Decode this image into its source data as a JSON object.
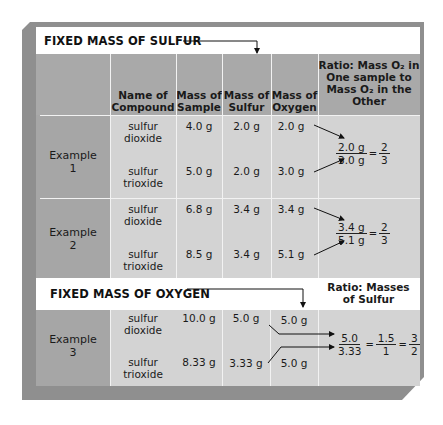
{
  "sections": {
    "fixed_sulfur_title": "FIXED MASS OF SULFUR",
    "fixed_oxygen_title": "FIXED MASS OF OXYGEN",
    "oxygen_ratio_header": [
      "Ratio: Masses",
      "of Sulfur"
    ]
  },
  "headers": {
    "name": [
      "Name of",
      "Compound"
    ],
    "sample": [
      "Mass of",
      "Sample"
    ],
    "sulfur": [
      "Mass of",
      "Sulfur"
    ],
    "oxygen": [
      "Mass of",
      "Oxygen"
    ],
    "ratio": [
      "Ratio: Mass O₂ in",
      "One sample to",
      "Mass O₂ in the",
      "Other"
    ]
  },
  "examples": [
    {
      "label": [
        "Example",
        "1"
      ],
      "rows": [
        {
          "name": [
            "sulfur",
            "dioxide"
          ],
          "sample": "4.0 g",
          "sulfur": "2.0 g",
          "oxygen": "2.0 g"
        },
        {
          "name": [
            "sulfur",
            "trioxide"
          ],
          "sample": "5.0 g",
          "sulfur": "2.0 g",
          "oxygen": "3.0 g"
        }
      ],
      "ratio": {
        "num": "2.0 g",
        "den": "3.0 g",
        "eq": "=",
        "rnum": "2",
        "rden": "3"
      }
    },
    {
      "label": [
        "Example",
        "2"
      ],
      "rows": [
        {
          "name": [
            "sulfur",
            "dioxide"
          ],
          "sample": "6.8 g",
          "sulfur": "3.4 g",
          "oxygen": "3.4 g"
        },
        {
          "name": [
            "sulfur",
            "trioxide"
          ],
          "sample": "8.5 g",
          "sulfur": "3.4 g",
          "oxygen": "5.1 g"
        }
      ],
      "ratio": {
        "num": "3.4 g",
        "den": "5.1 g",
        "eq": "=",
        "rnum": "2",
        "rden": "3"
      }
    },
    {
      "label": [
        "Example",
        "3"
      ],
      "rows": [
        {
          "name": [
            "sulfur",
            "dioxide"
          ],
          "sample": "10.0 g",
          "sulfur": "5.0 g",
          "oxygen": "5.0 g"
        },
        {
          "name": [
            "sulfur",
            "trioxide"
          ],
          "sample": "8.33 g",
          "sulfur": "3.33 g",
          "oxygen": "5.0 g"
        }
      ],
      "ratio": {
        "num": "5.0",
        "den": "3.33",
        "eq": "=",
        "mnum": "1.5",
        "mden": "1",
        "eq2": "=",
        "rnum": "3",
        "rden": "2"
      }
    }
  ],
  "colors": {
    "header_gray": "#a9a9a9",
    "body_gray": "#d3d3d3",
    "left_col_gray": "#a6a6a6",
    "frame_gray": "#8f8f8f",
    "band_white": "#ffffff"
  }
}
